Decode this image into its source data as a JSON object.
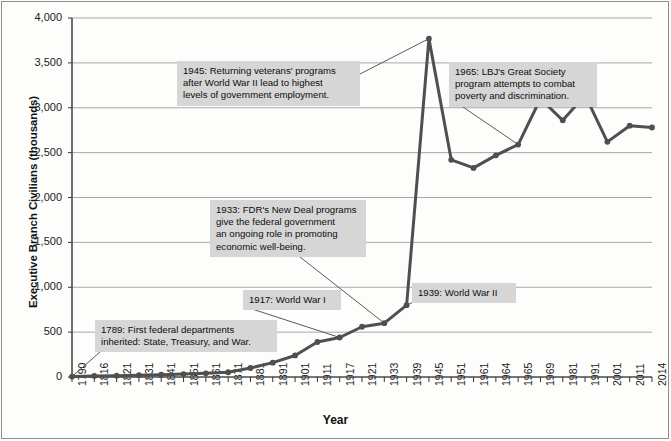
{
  "chart_data": {
    "type": "line",
    "title": "",
    "xlabel": "Year",
    "ylabel": "Executive Branch Civilians (thousands)",
    "ylim": [
      0,
      4000
    ],
    "ytick_values": [
      0,
      500,
      1000,
      1500,
      2000,
      2500,
      3000,
      3500,
      4000
    ],
    "ytick_labels": [
      "0",
      "500",
      "1,000",
      "1,500",
      "2,000",
      "2,500",
      "3,000",
      "3,500",
      "4,000"
    ],
    "grid": "horizontal",
    "legend": "none",
    "line_color": "#4f4f4f",
    "marker": "circle",
    "categories": [
      "1790",
      "1816",
      "1821",
      "1831",
      "1841",
      "1851",
      "1861",
      "1871",
      "1881",
      "1891",
      "1901",
      "1911",
      "1917",
      "1921",
      "1933",
      "1939",
      "1945",
      "1951",
      "1961",
      "1964",
      "1965",
      "1969",
      "1981",
      "1991",
      "2001",
      "2011",
      "2014"
    ],
    "values": [
      5,
      12,
      15,
      20,
      25,
      33,
      41,
      53,
      100,
      160,
      240,
      390,
      440,
      560,
      600,
      800,
      3770,
      2420,
      2330,
      2470,
      2590,
      3100,
      2860,
      3140,
      2620,
      2800,
      2780
    ],
    "annotations": [
      {
        "id": "ann-1789",
        "text": "1789: First federal departments\ninherited: State, Treasury, and War.",
        "target_category": "1790",
        "target_value": 5
      },
      {
        "id": "ann-1917",
        "text": "1917: World War I",
        "target_category": "1917",
        "target_value": 440
      },
      {
        "id": "ann-1933",
        "text": "1933: FDR's New Deal programs\ngive the federal government\nan ongoing role in promoting\neconomic well-being.",
        "target_category": "1933",
        "target_value": 600
      },
      {
        "id": "ann-1939",
        "text": "1939: World War II",
        "target_category": "1939",
        "target_value": 800
      },
      {
        "id": "ann-1945",
        "text": "1945: Returning veterans' programs\nafter World War II lead to highest\nlevels of government employment.",
        "target_category": "1945",
        "target_value": 3770
      },
      {
        "id": "ann-1965",
        "text": "1965: LBJ's Great Society\nprogram attempts to combat\npoverty and discrimination.",
        "target_category": "1965",
        "target_value": 2590
      }
    ]
  }
}
